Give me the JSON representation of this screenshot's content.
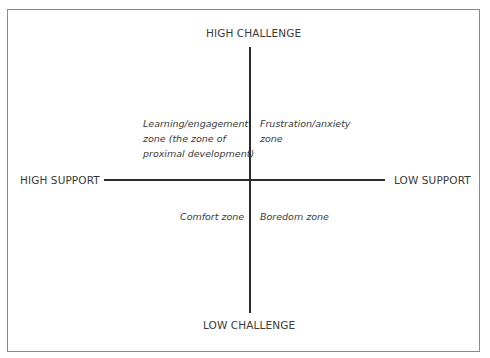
{
  "diagram": {
    "top_cutoff_text": "…upport and challenge …",
    "axes": {
      "top": "HIGH CHALLENGE",
      "bottom": "LOW CHALLENGE",
      "left": "HIGH SUPPORT",
      "right": "LOW SUPPORT"
    },
    "quadrants": {
      "top_left": {
        "line1": "Learning/engagement",
        "line2": "zone (the zone of",
        "line3": "proximal development)"
      },
      "top_right": {
        "line1": "Frustration/anxiety",
        "line2": "zone"
      },
      "bottom_left": {
        "line1": "Comfort zone"
      },
      "bottom_right": {
        "line1": "Boredom zone"
      }
    }
  }
}
